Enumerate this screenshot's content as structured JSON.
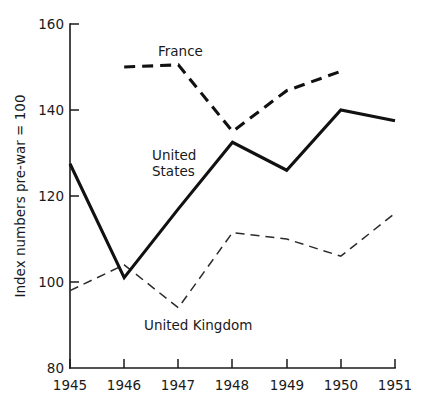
{
  "chart_data": {
    "type": "line",
    "title": "",
    "subtitle": "",
    "xlabel": "",
    "ylabel": "Index numbers pre-war = 100",
    "x": [
      1945,
      1946,
      1947,
      1948,
      1949,
      1950,
      1951
    ],
    "categories": [
      "1945",
      "1946",
      "1947",
      "1948",
      "1949",
      "1950",
      "1951"
    ],
    "xlim": [
      1945,
      1951
    ],
    "ylim": [
      80,
      160
    ],
    "yticks": [
      80,
      100,
      120,
      140,
      160
    ],
    "ytick_labels": [
      "80",
      "100",
      "120",
      "140",
      "160"
    ],
    "xticks": [
      1945,
      1946,
      1947,
      1948,
      1949,
      1950,
      1951
    ],
    "xtick_labels": [
      "1945",
      "1946",
      "1947",
      "1948",
      "1949",
      "1950",
      "1951"
    ],
    "grid": false,
    "legend": "inline-annotations",
    "series": [
      {
        "name": "United States",
        "style": "solid",
        "color": "#111111",
        "x": [
          1945,
          1946,
          1947,
          1948,
          1949,
          1950,
          1951
        ],
        "values": [
          127.5,
          101,
          117,
          132.5,
          126,
          140,
          137.5
        ]
      },
      {
        "name": "France",
        "style": "dashed-bold",
        "color": "#111111",
        "x": [
          1946,
          1947,
          1948,
          1949,
          1950
        ],
        "values": [
          150,
          150.5,
          135,
          144.5,
          149
        ]
      },
      {
        "name": "United Kingdom",
        "style": "dashed-thin",
        "color": "#2b2b2b",
        "x": [
          1945,
          1946,
          1947,
          1948,
          1949,
          1950,
          1951
        ],
        "values": [
          98,
          104,
          94,
          111.5,
          110,
          106,
          116
        ]
      }
    ],
    "annotations": [
      {
        "text": "France",
        "x": 1947.0,
        "y": 155.5
      },
      {
        "text": "United",
        "x": 1946.95,
        "y": 130.5
      },
      {
        "text": "States",
        "x": 1946.95,
        "y": 127.0
      },
      {
        "text": "United Kingdom",
        "x": 1947.35,
        "y": 89.0
      }
    ]
  },
  "axes": {
    "y_axis_title": "Index numbers pre-war = 100",
    "y_tick_80": "80",
    "y_tick_100": "100",
    "y_tick_120": "120",
    "y_tick_140": "140",
    "y_tick_160": "160",
    "x_tick_1945": "1945",
    "x_tick_1946": "1946",
    "x_tick_1947": "1947",
    "x_tick_1948": "1948",
    "x_tick_1949": "1949",
    "x_tick_1950": "1950",
    "x_tick_1951": "1951"
  },
  "labels": {
    "france": "France",
    "united_states_line1": "United",
    "united_states_line2": "States",
    "united_kingdom": "United Kingdom"
  }
}
